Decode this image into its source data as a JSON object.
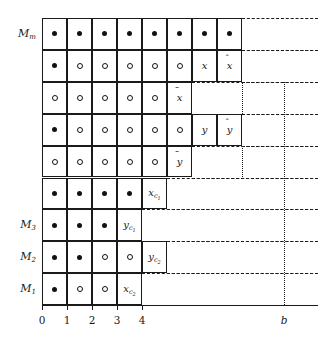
{
  "figure": {
    "kind": "schedule-grid-diagram",
    "geometry": {
      "grid_left": 42,
      "grid_top": 18,
      "col_width": 25,
      "row_height": 31.9,
      "n_cols_max": 8,
      "n_rows": 9,
      "b_x": 284
    },
    "colors": {
      "ink": "#1a1a1a",
      "paper": "#ffffff"
    }
  },
  "rows": [
    {
      "id": "row-Mm",
      "label": "M",
      "label_sub": "m",
      "has_label": true,
      "cells": [
        {
          "type": "dot-filled"
        },
        {
          "type": "dot-filled"
        },
        {
          "type": "dot-filled"
        },
        {
          "type": "dot-filled"
        },
        {
          "type": "dot-filled"
        },
        {
          "type": "dot-filled"
        },
        {
          "type": "dot-filled"
        },
        {
          "type": "dot-filled"
        }
      ]
    },
    {
      "id": "row-8",
      "label": "",
      "label_sub": "",
      "has_label": false,
      "cells": [
        {
          "type": "dot-filled"
        },
        {
          "type": "dot-open"
        },
        {
          "type": "dot-open"
        },
        {
          "type": "dot-open"
        },
        {
          "type": "dot-open"
        },
        {
          "type": "dot-open"
        },
        {
          "type": "text",
          "base": "x",
          "accent": "",
          "sub": "",
          "sub2": ""
        },
        {
          "type": "text",
          "base": "x",
          "accent": "hat",
          "sub": "",
          "sub2": ""
        }
      ]
    },
    {
      "id": "row-7",
      "label": "",
      "label_sub": "",
      "has_label": false,
      "cells": [
        {
          "type": "dot-open"
        },
        {
          "type": "dot-open"
        },
        {
          "type": "dot-open"
        },
        {
          "type": "dot-open"
        },
        {
          "type": "dot-open"
        },
        {
          "type": "text",
          "base": "x",
          "accent": "bar",
          "sub": "",
          "sub2": ""
        }
      ]
    },
    {
      "id": "row-6",
      "label": "",
      "label_sub": "",
      "has_label": false,
      "cells": [
        {
          "type": "dot-filled"
        },
        {
          "type": "dot-open"
        },
        {
          "type": "dot-open"
        },
        {
          "type": "dot-open"
        },
        {
          "type": "dot-open"
        },
        {
          "type": "dot-open"
        },
        {
          "type": "text",
          "base": "y",
          "accent": "",
          "sub": "",
          "sub2": ""
        },
        {
          "type": "text",
          "base": "y",
          "accent": "hat",
          "sub": "",
          "sub2": ""
        }
      ]
    },
    {
      "id": "row-5",
      "label": "",
      "label_sub": "",
      "has_label": false,
      "cells": [
        {
          "type": "dot-open"
        },
        {
          "type": "dot-open"
        },
        {
          "type": "dot-open"
        },
        {
          "type": "dot-open"
        },
        {
          "type": "dot-open"
        },
        {
          "type": "text",
          "base": "y",
          "accent": "bar",
          "sub": "",
          "sub2": ""
        }
      ]
    },
    {
      "id": "row-4",
      "label": "",
      "label_sub": "",
      "has_label": false,
      "cells": [
        {
          "type": "dot-filled"
        },
        {
          "type": "dot-filled"
        },
        {
          "type": "dot-filled"
        },
        {
          "type": "dot-filled"
        },
        {
          "type": "text",
          "base": "x",
          "accent": "",
          "sub": "c",
          "sub2": "1"
        }
      ]
    },
    {
      "id": "row-M3",
      "label": "M",
      "label_sub": "3",
      "has_label": true,
      "cells": [
        {
          "type": "dot-filled"
        },
        {
          "type": "dot-filled"
        },
        {
          "type": "dot-filled"
        },
        {
          "type": "text",
          "base": "y",
          "accent": "",
          "sub": "c",
          "sub2": "1"
        }
      ]
    },
    {
      "id": "row-M2",
      "label": "M",
      "label_sub": "2",
      "has_label": true,
      "cells": [
        {
          "type": "dot-filled"
        },
        {
          "type": "dot-filled"
        },
        {
          "type": "dot-open"
        },
        {
          "type": "dot-open"
        },
        {
          "type": "text",
          "base": "y",
          "accent": "",
          "sub": "c",
          "sub2": "2"
        }
      ]
    },
    {
      "id": "row-M1",
      "label": "M",
      "label_sub": "1",
      "has_label": true,
      "cells": [
        {
          "type": "dot-filled"
        },
        {
          "type": "dot-open"
        },
        {
          "type": "dot-open"
        },
        {
          "type": "text",
          "base": "x",
          "accent": "",
          "sub": "c",
          "sub2": "2"
        }
      ]
    }
  ],
  "x_axis": {
    "ticks": [
      {
        "value": "0",
        "italic": false
      },
      {
        "value": "1",
        "italic": false
      },
      {
        "value": "2",
        "italic": false
      },
      {
        "value": "3",
        "italic": false
      },
      {
        "value": "4",
        "italic": false
      }
    ],
    "end_label": {
      "value": "b",
      "italic": true
    }
  }
}
